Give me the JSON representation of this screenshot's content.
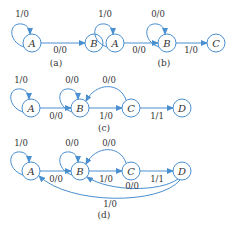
{
  "diagrams": {
    "a": {
      "caption": "(a)",
      "states": [
        "A",
        "B"
      ],
      "transitions": [
        {
          "from": "A",
          "to": "A",
          "label": "1/0"
        },
        {
          "from": "A",
          "to": "B",
          "label": "0/0"
        }
      ]
    },
    "b": {
      "caption": "(b)",
      "states": [
        "A",
        "B",
        "C"
      ],
      "transitions": [
        {
          "from": "A",
          "to": "A",
          "label": "1/0"
        },
        {
          "from": "A",
          "to": "B",
          "label": "0/0"
        },
        {
          "from": "B",
          "to": "B",
          "label": "0/0"
        },
        {
          "from": "B",
          "to": "C",
          "label": "1/0"
        }
      ]
    },
    "c": {
      "caption": "(c)",
      "states": [
        "A",
        "B",
        "C",
        "D"
      ],
      "transitions": [
        {
          "from": "A",
          "to": "A",
          "label": "1/0"
        },
        {
          "from": "A",
          "to": "B",
          "label": "0/0"
        },
        {
          "from": "B",
          "to": "B",
          "label": "0/0"
        },
        {
          "from": "B",
          "to": "C",
          "label": "1/0"
        },
        {
          "from": "C",
          "to": "B",
          "label": "0/0"
        },
        {
          "from": "C",
          "to": "D",
          "label": "1/1"
        }
      ]
    },
    "d": {
      "caption": "(d)",
      "states": [
        "A",
        "B",
        "C",
        "D"
      ],
      "transitions": [
        {
          "from": "A",
          "to": "A",
          "label": "1/0"
        },
        {
          "from": "A",
          "to": "B",
          "label": "0/0"
        },
        {
          "from": "B",
          "to": "B",
          "label": "0/0"
        },
        {
          "from": "B",
          "to": "C",
          "label": "1/0"
        },
        {
          "from": "C",
          "to": "B",
          "label": "0/0"
        },
        {
          "from": "C",
          "to": "D",
          "label": "1/1"
        },
        {
          "from": "D",
          "to": "B",
          "label": "0/0"
        },
        {
          "from": "D",
          "to": "A",
          "label": "1/0"
        }
      ]
    }
  },
  "colors": {
    "edge": "#4a8fd0",
    "text": "#333333"
  }
}
